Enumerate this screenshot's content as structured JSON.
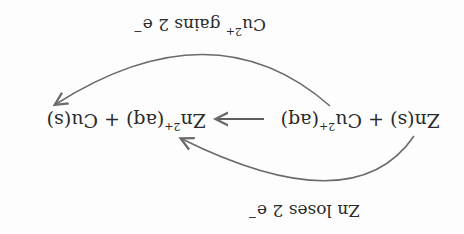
{
  "diagram": {
    "orientation": "rotated 180 degrees",
    "equation": {
      "reactant1": "Zn(s)",
      "plus1": "+",
      "reactant2_base": "Cu",
      "reactant2_charge": "2+",
      "reactant2_state": "(aq)",
      "arrow": "⟶",
      "product1_base": "Zn",
      "product1_charge": "2+",
      "product1_state": "(aq)",
      "plus2": "+",
      "product2": "Cu(s)"
    },
    "labels": {
      "cu_label_base": "Cu",
      "cu_label_charge": "2+",
      "cu_label_rest": " gains 2 e",
      "cu_label_electron": "−",
      "zn_label": "Zn loses 2 e",
      "zn_label_electron": "−"
    },
    "colors": {
      "text": "#2a2a2a",
      "arrow": "#6a6a6a"
    }
  }
}
